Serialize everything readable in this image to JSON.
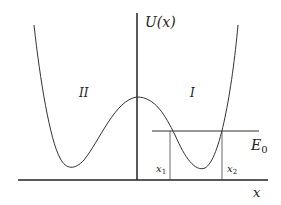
{
  "diagram": {
    "y_axis_label": "U(x)",
    "x_axis_label": "x",
    "region_left": "II",
    "region_right": "I",
    "energy_label": "E",
    "energy_subscript": "0",
    "turning_point_1": "x",
    "turning_point_1_sub": "1",
    "turning_point_2": "x",
    "turning_point_2_sub": "2",
    "colors": {
      "line": "#222222",
      "background": "#ffffff"
    }
  }
}
